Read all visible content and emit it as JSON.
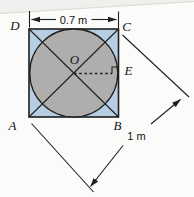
{
  "figure": {
    "points": {
      "A": "A",
      "B": "B",
      "C": "C",
      "D": "D",
      "E": "E",
      "O": "O"
    },
    "dimensions": {
      "top_side": "0.7 m",
      "diagonal": "1 m"
    },
    "colors": {
      "square_fill": "#b6cde2",
      "circle_fill": "#b0aeac",
      "line": "#1f1f1f",
      "background": "#fbfbfa",
      "page_edge_fill": "#efefed",
      "page_edge_line": "#d9d9d6"
    }
  }
}
